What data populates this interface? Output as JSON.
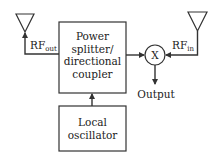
{
  "diagram": {
    "type": "block-diagram",
    "blocks": {
      "splitter": {
        "line1": "Power",
        "line2": "splitter/",
        "line3": "directional",
        "line4": "coupler"
      },
      "oscillator": {
        "line1": "Local",
        "line2": "oscillator"
      },
      "mixer": {
        "symbol": "X"
      }
    },
    "labels": {
      "rf_out": {
        "main": "RF",
        "sub": "out"
      },
      "rf_in": {
        "main": "RF",
        "sub": "in"
      },
      "output": "Output"
    },
    "antennas": [
      "transmit-antenna",
      "receive-antenna"
    ],
    "connections": [
      {
        "from": "splitter",
        "to": "transmit-antenna",
        "label": "RF_out"
      },
      {
        "from": "receive-antenna",
        "to": "mixer",
        "label": "RF_in"
      },
      {
        "from": "splitter",
        "to": "mixer"
      },
      {
        "from": "oscillator",
        "to": "splitter"
      },
      {
        "from": "mixer",
        "to": "output",
        "label": "Output"
      }
    ],
    "colors": {
      "stroke": "#333333",
      "background": "#ffffff"
    }
  }
}
